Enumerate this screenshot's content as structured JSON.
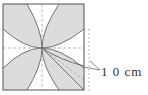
{
  "diagram": {
    "type": "geometry-figure",
    "dimension_label": "1 0 cm",
    "colors": {
      "shade": "#dcdcdc",
      "stroke": "#555555",
      "dash": "#999999",
      "background": "#ffffff"
    }
  }
}
